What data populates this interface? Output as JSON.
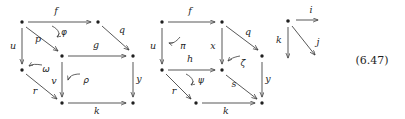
{
  "figure": {
    "kind": "commutative-diagrams",
    "equation_number": "(6.47)",
    "background_color": "#ffffff",
    "ink_color": "#1f1f1f",
    "diagrams": [
      {
        "id": "diagram-left",
        "vertices": [
          {
            "name": "top-left",
            "x": 22,
            "y": 22
          },
          {
            "name": "top-right",
            "x": 98,
            "y": 22
          },
          {
            "name": "mid-left",
            "x": 22,
            "y": 70
          },
          {
            "name": "mid-center",
            "x": 62,
            "y": 56
          },
          {
            "name": "mid-right",
            "x": 133,
            "y": 56
          },
          {
            "name": "bottom-center",
            "x": 62,
            "y": 103
          },
          {
            "name": "bottom-right",
            "x": 133,
            "y": 103
          }
        ],
        "edges": [
          {
            "label": "f",
            "from": "top-left",
            "to": "top-right",
            "label_x": 56,
            "label_y": 14
          },
          {
            "label": "q",
            "from": "top-right",
            "to": "mid-right",
            "label_x": 122,
            "label_y": 33
          },
          {
            "label": "u",
            "from": "top-left",
            "to": "mid-left",
            "label_x": 13,
            "label_y": 49
          },
          {
            "label": "p",
            "from": "top-left",
            "to": "mid-center",
            "label_x": 38,
            "label_y": 42
          },
          {
            "label": "g",
            "from": "mid-center",
            "to": "mid-right",
            "label_x": 96,
            "label_y": 48
          },
          {
            "label": "v",
            "from": "mid-center",
            "to": "bottom-center",
            "label_x": 54,
            "label_y": 84
          },
          {
            "label": "y",
            "from": "mid-right",
            "to": "bottom-right",
            "label_x": 139,
            "label_y": 82
          },
          {
            "label": "r",
            "from": "mid-left",
            "to": "bottom-center",
            "label_x": 35,
            "label_y": 94
          },
          {
            "label": "k",
            "from": "bottom-center",
            "to": "bottom-right",
            "label_x": 97,
            "label_y": 114
          }
        ],
        "two_cells": [
          {
            "label": "φ",
            "label_x": 64,
            "label_y": 32,
            "name": "phi"
          },
          {
            "label": "ω",
            "label_x": 46,
            "label_y": 66,
            "name": "omega"
          },
          {
            "label": "ρ",
            "label_x": 84,
            "label_y": 80,
            "name": "rho"
          }
        ]
      },
      {
        "id": "diagram-middle",
        "vertices": [
          {
            "name": "top-left",
            "x": 162,
            "y": 22
          },
          {
            "name": "top-right",
            "x": 222,
            "y": 22
          },
          {
            "name": "mid-left",
            "x": 162,
            "y": 70
          },
          {
            "name": "mid-center",
            "x": 222,
            "y": 70
          },
          {
            "name": "mid-right",
            "x": 262,
            "y": 56
          },
          {
            "name": "bottom-center",
            "x": 196,
            "y": 103
          },
          {
            "name": "bottom-right",
            "x": 262,
            "y": 103
          }
        ],
        "edges": [
          {
            "label": "f",
            "from": "top-left",
            "to": "top-right",
            "label_x": 190,
            "label_y": 14
          },
          {
            "label": "q",
            "from": "top-right",
            "to": "mid-right",
            "label_x": 248,
            "label_y": 35
          },
          {
            "label": "u",
            "from": "top-left",
            "to": "mid-left",
            "label_x": 153,
            "label_y": 49
          },
          {
            "label": "x",
            "from": "top-right",
            "to": "mid-center",
            "label_x": 213,
            "label_y": 49
          },
          {
            "label": "h",
            "from": "mid-left",
            "to": "mid-center",
            "label_x": 190,
            "label_y": 62
          },
          {
            "label": "y",
            "from": "mid-right",
            "to": "bottom-right",
            "label_x": 268,
            "label_y": 82
          },
          {
            "label": "r",
            "from": "mid-left",
            "to": "bottom-center",
            "label_x": 174,
            "label_y": 94
          },
          {
            "label": "s",
            "from": "mid-center",
            "to": "bottom-right",
            "label_x": 234,
            "label_y": 87
          },
          {
            "label": "k",
            "from": "bottom-center",
            "to": "bottom-right",
            "label_x": 226,
            "label_y": 114
          }
        ],
        "two_cells": [
          {
            "label": "π",
            "label_x": 182,
            "label_y": 44,
            "name": "pi"
          },
          {
            "label": "ψ",
            "label_x": 200,
            "label_y": 80,
            "name": "psi"
          },
          {
            "label": "ζ",
            "label_x": 240,
            "label_y": 62,
            "name": "zeta"
          }
        ]
      },
      {
        "id": "diagram-right",
        "vertices": [
          {
            "name": "apex",
            "x": 288,
            "y": 21
          }
        ],
        "edges": [
          {
            "label": "i",
            "from": "apex",
            "to": "right",
            "label_x": 311,
            "label_y": 13
          },
          {
            "label": "k",
            "from": "apex",
            "to": "down",
            "label_x": 279,
            "label_y": 40
          },
          {
            "label": "j",
            "from": "apex",
            "to": "down-right",
            "label_x": 316,
            "label_y": 42
          }
        ],
        "two_cells": []
      }
    ]
  }
}
